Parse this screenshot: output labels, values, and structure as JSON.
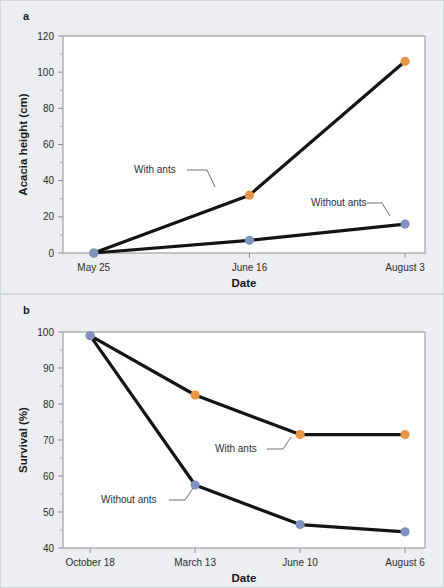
{
  "figure": {
    "background_color": "#eceef1",
    "plot_background_color": "#ffffff",
    "line_color": "#141414"
  },
  "series_colors": {
    "with_ants": "#E89445",
    "without_ants": "#7F93C0"
  },
  "panels": [
    {
      "label": "a",
      "xlabel": "Date",
      "ylabel": "Acacia height (cm)",
      "categories": [
        "May 25",
        "June 16",
        "August 3"
      ],
      "yticks": [
        "0",
        "20",
        "40",
        "60",
        "80",
        "100",
        "120"
      ],
      "annotations": [
        {
          "text": "With ants"
        },
        {
          "text": "Without ants"
        }
      ]
    },
    {
      "label": "b",
      "xlabel": "Date",
      "ylabel": "Survival (%)",
      "categories": [
        "October 18",
        "March 13",
        "June 10",
        "August 6"
      ],
      "yticks": [
        "40",
        "50",
        "60",
        "70",
        "80",
        "90",
        "100"
      ],
      "annotations": [
        {
          "text": "With ants"
        },
        {
          "text": "Without ants"
        }
      ]
    }
  ],
  "chart_data": [
    {
      "type": "line",
      "title": "a",
      "xlabel": "Date",
      "ylabel": "Acacia height (cm)",
      "categories": [
        "May 25",
        "June 16",
        "August 3"
      ],
      "ylim": [
        0,
        120
      ],
      "ytick_step": 20,
      "yminor_step": 10,
      "grid": false,
      "legend": "inline-annotations",
      "series": [
        {
          "name": "With ants",
          "color": "#E89445",
          "values": [
            0,
            32,
            106
          ]
        },
        {
          "name": "Without ants",
          "color": "#7F93C0",
          "values": [
            0,
            7,
            16
          ]
        }
      ]
    },
    {
      "type": "line",
      "title": "b",
      "xlabel": "Date",
      "ylabel": "Survival (%)",
      "categories": [
        "October 18",
        "March 13",
        "June 10",
        "August 6"
      ],
      "ylim": [
        40,
        100
      ],
      "ytick_step": 10,
      "yminor_step": 5,
      "grid": false,
      "legend": "inline-annotations",
      "series": [
        {
          "name": "With ants",
          "color": "#E89445",
          "values": [
            99,
            82.5,
            71.5,
            71.5
          ]
        },
        {
          "name": "Without ants",
          "color": "#7F93C0",
          "values": [
            99,
            57.5,
            46.5,
            44.5
          ]
        }
      ]
    }
  ]
}
